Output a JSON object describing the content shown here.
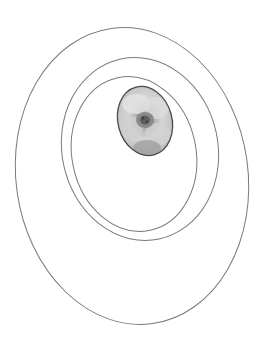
{
  "canvas": {
    "width": 264,
    "height": 350,
    "background": "#ffffff"
  },
  "stroke_color": "#7a7a7a",
  "ellipses": [
    {
      "name": "outer-ring",
      "cx": 132,
      "cy": 176,
      "rx": 116,
      "ry": 149,
      "rotate": -8
    },
    {
      "name": "middle-ring",
      "cx": 140,
      "cy": 149,
      "rx": 78,
      "ry": 92,
      "rotate": -12
    },
    {
      "name": "inner-ring",
      "cx": 134,
      "cy": 154,
      "rx": 62,
      "ry": 78,
      "rotate": -12
    }
  ],
  "flower_image": {
    "cx": 145,
    "cy": 121,
    "rx": 27,
    "ry": 35,
    "rotate": -15,
    "subject": "rose-flower-photo",
    "tone": "grayscale"
  }
}
